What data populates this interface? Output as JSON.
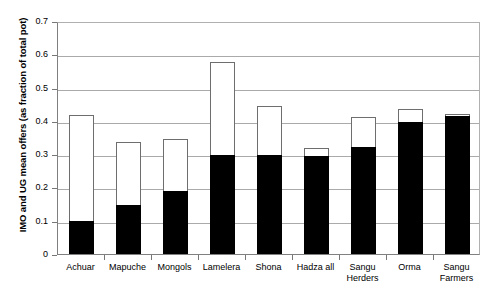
{
  "chart_data": {
    "type": "bar",
    "title": "",
    "xlabel": "",
    "ylabel": "IMO and UG mean offers (as fraction of total pot)",
    "ylim": [
      0,
      0.7
    ],
    "ytick_labels": [
      "0",
      "0.1",
      "0.2",
      "0.3",
      "0.4",
      "0.5",
      "0.6",
      "0.7"
    ],
    "ytick_values": [
      0,
      0.1,
      0.2,
      0.3,
      0.4,
      0.5,
      0.6,
      0.7
    ],
    "grid": "horizontal",
    "legend": "none",
    "categories": [
      "Achuar",
      "Mapuche",
      "Mongols",
      "Lamelera",
      "Shona",
      "Hadza all",
      "Sangu\nHerders",
      "Orma",
      "Sangu\nFarmers"
    ],
    "series": [
      {
        "name": "IMO mean offer",
        "fill": "#000000",
        "values": [
          0.1,
          0.148,
          0.188,
          0.297,
          0.297,
          0.295,
          0.322,
          0.397,
          0.415
        ]
      },
      {
        "name": "UG mean offer",
        "fill": "#ffffff",
        "values": [
          0.418,
          0.338,
          0.345,
          0.578,
          0.445,
          0.32,
          0.413,
          0.435,
          0.422
        ]
      }
    ]
  },
  "axis_style": {
    "gridline_color": "#aaaaaa",
    "axis_color": "#808080",
    "bar_outline_color": "#6e6e6e"
  }
}
